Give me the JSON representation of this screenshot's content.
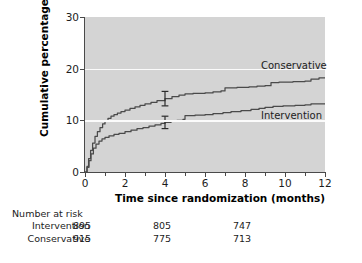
{
  "chart_data": {
    "type": "line",
    "title": "",
    "subtitle": "",
    "xlabel": "Time since randomization (months)",
    "ylabel": "Cumulative percentage",
    "xlim": [
      0,
      12
    ],
    "ylim": [
      0,
      30
    ],
    "xticks": [
      0,
      2,
      4,
      6,
      8,
      10,
      12
    ],
    "xtick_labels": [
      "0",
      "2",
      "4",
      "6",
      "8",
      "10",
      "12"
    ],
    "xminor_ticks": [
      1,
      3,
      5,
      7,
      9,
      11
    ],
    "yticks": [
      0,
      10,
      20,
      30
    ],
    "ytick_labels": [
      "0",
      "10",
      "20",
      "30"
    ],
    "gridlines_y": [
      10,
      20
    ],
    "grid": "horizontal-white",
    "legend_position": "inline-right",
    "plot_background": "#d4d4d4",
    "line_color": "#4a4a4a",
    "series": [
      {
        "name": "Conservative",
        "label_x": 12.0,
        "label_y": 19.3,
        "error_bar": {
          "x": 4,
          "y": 14.2,
          "low": 12.8,
          "high": 15.6
        },
        "points": [
          [
            0.0,
            0.0
          ],
          [
            0.1,
            1.1
          ],
          [
            0.18,
            2.6
          ],
          [
            0.28,
            4.2
          ],
          [
            0.38,
            5.6
          ],
          [
            0.5,
            6.9
          ],
          [
            0.62,
            7.8
          ],
          [
            0.75,
            8.6
          ],
          [
            0.88,
            9.3
          ],
          [
            1.0,
            9.9
          ],
          [
            1.15,
            10.4
          ],
          [
            1.3,
            10.8
          ],
          [
            1.45,
            11.1
          ],
          [
            1.62,
            11.4
          ],
          [
            1.8,
            11.7
          ],
          [
            2.0,
            12.0
          ],
          [
            2.25,
            12.3
          ],
          [
            2.5,
            12.6
          ],
          [
            2.75,
            12.9
          ],
          [
            3.0,
            13.2
          ],
          [
            3.3,
            13.5
          ],
          [
            3.6,
            13.8
          ],
          [
            4.0,
            14.2
          ],
          [
            4.35,
            14.6
          ],
          [
            4.7,
            14.9
          ],
          [
            5.0,
            15.1
          ],
          [
            5.4,
            15.2
          ],
          [
            6.0,
            15.3
          ],
          [
            6.4,
            15.5
          ],
          [
            6.8,
            15.7
          ],
          [
            7.0,
            16.3
          ],
          [
            7.6,
            16.4
          ],
          [
            8.2,
            16.5
          ],
          [
            8.6,
            16.6
          ],
          [
            9.0,
            16.7
          ],
          [
            9.3,
            17.3
          ],
          [
            9.7,
            17.4
          ],
          [
            10.4,
            17.5
          ],
          [
            11.0,
            17.6
          ],
          [
            11.3,
            18.0
          ],
          [
            11.7,
            18.2
          ],
          [
            12.0,
            18.3
          ]
        ]
      },
      {
        "name": "Intervention",
        "label_x": 12.0,
        "label_y": 11.8,
        "error_bar": {
          "x": 4,
          "y": 9.6,
          "low": 8.4,
          "high": 10.8
        },
        "points": [
          [
            0.0,
            0.0
          ],
          [
            0.1,
            0.9
          ],
          [
            0.2,
            2.2
          ],
          [
            0.3,
            3.5
          ],
          [
            0.42,
            4.6
          ],
          [
            0.55,
            5.4
          ],
          [
            0.7,
            6.0
          ],
          [
            0.85,
            6.4
          ],
          [
            1.0,
            6.7
          ],
          [
            1.2,
            7.0
          ],
          [
            1.45,
            7.3
          ],
          [
            1.7,
            7.5
          ],
          [
            2.0,
            7.8
          ],
          [
            2.3,
            8.1
          ],
          [
            2.6,
            8.4
          ],
          [
            2.9,
            8.6
          ],
          [
            3.2,
            8.9
          ],
          [
            3.5,
            9.1
          ],
          [
            3.8,
            9.4
          ],
          [
            4.0,
            9.6
          ],
          [
            4.3,
            9.8
          ],
          [
            4.6,
            10.0
          ],
          [
            4.9,
            10.2
          ],
          [
            5.0,
            10.9
          ],
          [
            5.5,
            11.0
          ],
          [
            6.0,
            11.1
          ],
          [
            6.4,
            11.3
          ],
          [
            6.9,
            11.5
          ],
          [
            7.3,
            11.7
          ],
          [
            7.8,
            11.9
          ],
          [
            8.3,
            12.1
          ],
          [
            8.7,
            12.3
          ],
          [
            9.0,
            12.5
          ],
          [
            9.4,
            12.7
          ],
          [
            9.9,
            12.8
          ],
          [
            10.5,
            12.9
          ],
          [
            11.0,
            13.0
          ],
          [
            11.3,
            13.2
          ],
          [
            12.0,
            13.2
          ]
        ]
      }
    ],
    "risk_table": {
      "title": "Number at risk",
      "time_points": [
        0,
        4,
        8
      ],
      "rows": [
        {
          "label": "Intervention",
          "values": [
            "895",
            "805",
            "747"
          ]
        },
        {
          "label": "Conservative",
          "values": [
            "915",
            "775",
            "713"
          ]
        }
      ]
    }
  }
}
